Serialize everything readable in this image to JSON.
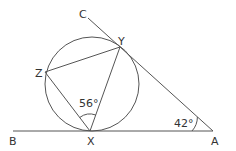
{
  "diagram": {
    "type": "geometry",
    "points": {
      "A": {
        "label": "A",
        "x": 213,
        "y": 131
      },
      "B": {
        "label": "B",
        "x": 13,
        "y": 131
      },
      "C": {
        "label": "C",
        "x": 88,
        "y": 18
      },
      "X": {
        "label": "X",
        "x": 90,
        "y": 131
      },
      "Y": {
        "label": "Y",
        "x": 120,
        "y": 47
      },
      "Z": {
        "label": "Z",
        "x": 45,
        "y": 72
      }
    },
    "circle": {
      "cx": 92,
      "cy": 84,
      "r": 47
    },
    "angles": {
      "ZXY": {
        "label": "56°",
        "vertex": "X"
      },
      "XAY": {
        "label": "42°",
        "vertex": "A"
      }
    },
    "colors": {
      "stroke": "#555555",
      "text": "#333333",
      "background": "#ffffff"
    }
  }
}
